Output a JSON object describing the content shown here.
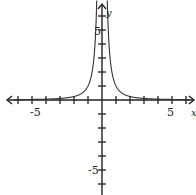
{
  "chart_data": {
    "type": "line",
    "title": "",
    "xlabel": "x",
    "ylabel": "y",
    "xlim": [
      -7,
      7
    ],
    "ylim": [
      -7,
      7
    ],
    "grid": false,
    "tick_labels": {
      "x": [
        "-5",
        "5"
      ],
      "y": [
        "5",
        "-5"
      ]
    },
    "series": [
      {
        "name": "f(x) = 1/x^2",
        "function": "1/x^2",
        "x": [
          -6,
          -4,
          -3,
          -2,
          -1,
          -0.5,
          -0.38,
          0.38,
          0.5,
          1,
          2,
          3,
          4,
          6
        ],
        "values": [
          0.03,
          0.06,
          0.11,
          0.25,
          1,
          4,
          6.9,
          6.9,
          4,
          1,
          0.25,
          0.11,
          0.06,
          0.03
        ]
      }
    ]
  },
  "labels": {
    "x_axis": "x",
    "y_axis": "y",
    "x_neg5": "-5",
    "x_pos5": "5",
    "y_pos5": "5",
    "y_neg5": "-5"
  },
  "style": {
    "axis_color": "#222222",
    "curve_color": "#333333"
  }
}
